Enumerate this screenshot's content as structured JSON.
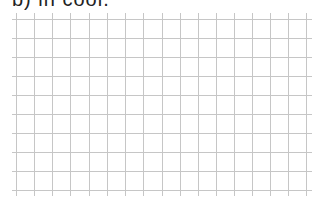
{
  "heading": {
    "text": "b) in cool."
  },
  "grid": {
    "line_color": "#c6c6c6",
    "columns": 16,
    "rows": 9,
    "vertical_x": [
      16,
      34,
      52,
      70,
      89,
      107,
      125,
      143,
      162,
      180,
      198,
      216,
      234,
      252,
      270,
      288,
      306
    ],
    "horizontal_y": [
      19,
      38,
      57,
      76,
      95,
      114,
      133,
      152,
      171,
      190
    ],
    "h_extent": [
      12,
      312
    ],
    "v_extent": [
      13,
      196
    ]
  }
}
